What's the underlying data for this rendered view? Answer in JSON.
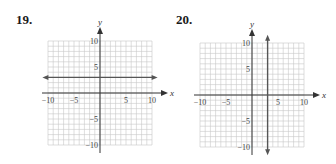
{
  "chart_data": [
    {
      "type": "line",
      "problem_number": "19.",
      "title": "",
      "xlabel": "x",
      "ylabel": "y",
      "xlim": [
        -10,
        10
      ],
      "ylim": [
        -10,
        10
      ],
      "grid": true,
      "x_ticks": [
        "−10",
        "−5",
        "5",
        "10"
      ],
      "y_ticks": [
        "10",
        "5",
        "−5",
        "−10"
      ],
      "series": [
        {
          "name": "horizontal line",
          "equation": "y = 3",
          "points": [
            [
              -10.5,
              3
            ],
            [
              10.5,
              3
            ]
          ],
          "arrows": "both ends"
        }
      ]
    },
    {
      "type": "line",
      "problem_number": "20.",
      "title": "",
      "xlabel": "x",
      "ylabel": "y",
      "xlim": [
        -10,
        10
      ],
      "ylim": [
        -10,
        10
      ],
      "grid": true,
      "x_ticks": [
        "−10",
        "−5",
        "5",
        "10"
      ],
      "y_ticks": [
        "10",
        "5",
        "−5",
        "−10"
      ],
      "series": [
        {
          "name": "vertical line",
          "equation": "x = 3",
          "points": [
            [
              3,
              -11
            ],
            [
              3,
              11
            ]
          ],
          "arrows": "both ends"
        }
      ]
    }
  ],
  "problems": [
    {
      "number": "19.",
      "x_axis_label": "x",
      "y_axis_label": "y",
      "x_tick_labels": [
        "−10",
        "−5",
        "5",
        "10"
      ],
      "y_tick_labels": [
        "10",
        "5",
        "−5",
        "−10"
      ]
    },
    {
      "number": "20.",
      "x_axis_label": "x",
      "y_axis_label": "y",
      "x_tick_labels": [
        "−10",
        "−5",
        "5",
        "10"
      ],
      "y_tick_labels": [
        "10",
        "5",
        "−5",
        "−10"
      ]
    }
  ],
  "colors": {
    "grid": "#c8c8c8",
    "axis": "#333333",
    "line": "#555555",
    "text": "#1a1a1a"
  }
}
